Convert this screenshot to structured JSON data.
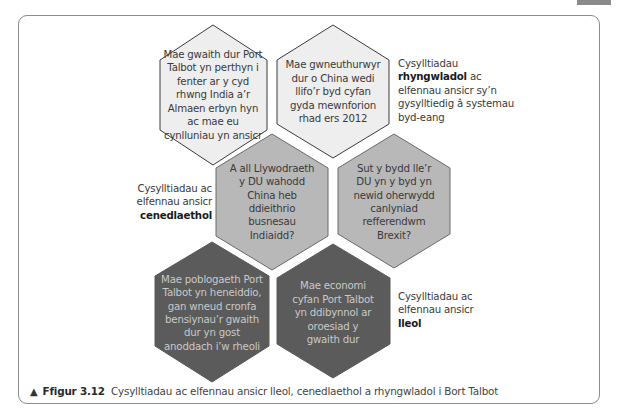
{
  "page_tab": {
    "color": "#8a8a8a"
  },
  "hexagons": [
    {
      "id": "top-left",
      "tier": "international",
      "fill": "#eeeeee",
      "text": "Mae gwaith dur Port Talbot yn perthyn i fenter ar y cyd rhwng India a’r Almaen erbyn hyn ac mae eu cynlluniau yn ansicr"
    },
    {
      "id": "top-right",
      "tier": "international",
      "fill": "#eeeeee",
      "text": "Mae gwneuthurwyr dur o China wedi llifo’r byd cyfan gyda mewnforion rhad ers 2012"
    },
    {
      "id": "mid-left",
      "tier": "national",
      "fill": "#b8b8b8",
      "text": "A all Llywodraeth y DU wahodd China heb ddieithrio busnesau Indiaidd?"
    },
    {
      "id": "mid-right",
      "tier": "national",
      "fill": "#b8b8b8",
      "text": "Sut y bydd lle’r DU yn y byd yn newid oherwydd canlyniad refferendwm Brexit?"
    },
    {
      "id": "bottom-left",
      "tier": "local",
      "fill": "#5b5b5b",
      "text": "Mae poblogaeth Port Talbot yn heneiddio, gan wneud cronfa bensiynau’r gwaith dur yn gost anoddach i’w rheoli"
    },
    {
      "id": "bottom-right",
      "tier": "local",
      "fill": "#5b5b5b",
      "text": "Mae economi cyfan Port Talbot yn ddibynnol ar oroesiad y gwaith dur"
    }
  ],
  "labels": {
    "international": {
      "pre": "Cysylltiadau",
      "bold": "rhyngwladol",
      "post": "ac elfennau ansicr sy’n gysylltiedig â systemau byd-eang"
    },
    "national": {
      "pre": "Cysylltiadau ac elfennau ansicr",
      "bold": "cenedlaethol"
    },
    "local": {
      "pre": "Cysylltiadau ac elfennau ansicr",
      "bold": "lleol"
    }
  },
  "caption": {
    "marker": "▲",
    "figure": "Ffigur 3.12",
    "text": "Cysylltiadau ac elfennau ansicr lleol, cenedlaethol a rhyngwladol i Bort Talbot"
  }
}
